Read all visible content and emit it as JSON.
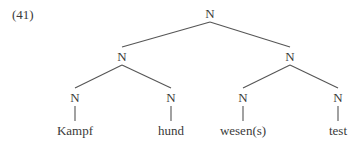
{
  "example_number": "(41)",
  "tree": {
    "root": {
      "label": "N",
      "x": 210,
      "y": 7
    },
    "internal": [
      {
        "label": "N",
        "x": 122,
        "y": 50
      },
      {
        "label": "N",
        "x": 290,
        "y": 50
      }
    ],
    "preterminals": [
      {
        "label": "N",
        "x": 75,
        "y": 91
      },
      {
        "label": "N",
        "x": 171,
        "y": 91
      },
      {
        "label": "N",
        "x": 243,
        "y": 91
      },
      {
        "label": "N",
        "x": 338,
        "y": 91
      }
    ],
    "leaves": [
      {
        "label": "Kampf",
        "x": 75,
        "y": 124
      },
      {
        "label": "hund",
        "x": 171,
        "y": 124
      },
      {
        "label": "wesen(s)",
        "x": 243,
        "y": 124
      },
      {
        "label": "test",
        "x": 338,
        "y": 124
      }
    ]
  },
  "colors": {
    "text": "#3a3a3a",
    "edge": "#555555",
    "background": "#ffffff"
  }
}
